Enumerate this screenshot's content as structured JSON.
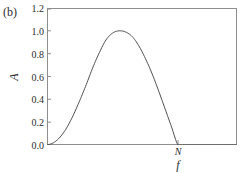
{
  "figure": {
    "panel_label": "(b)",
    "background_color": "#ffffff",
    "frame_color": "#8e8e8e",
    "curve_color": "#4d4d4d"
  },
  "chart_data": {
    "type": "line",
    "title": "",
    "subtitle": "",
    "panel": "(b)",
    "xlabel": "f",
    "ylabel": "A",
    "grid": false,
    "legend": false,
    "legend_position": "none",
    "xlim": [
      0,
      1.45
    ],
    "ylim": [
      0.0,
      1.2
    ],
    "yticks": [
      0.0,
      0.2,
      0.4,
      0.6,
      0.8,
      1.0,
      1.2
    ],
    "ytick_labels": [
      "0.0",
      "0.2",
      "0.4",
      "0.6",
      "0.8",
      "1.0",
      "1.2"
    ],
    "xticks": [
      1.0
    ],
    "xtick_labels": [
      "N"
    ],
    "annotations": [],
    "series": [
      {
        "name": "A(f)",
        "color": "#4d4d4d",
        "x": [
          0.0,
          0.05,
          0.1,
          0.15,
          0.2,
          0.25,
          0.3,
          0.35,
          0.4,
          0.45,
          0.5,
          0.55,
          0.6,
          0.65,
          0.7,
          0.75,
          0.8,
          0.85,
          0.9,
          0.95,
          1.0,
          1.05,
          1.1,
          1.2,
          1.3,
          1.45
        ],
        "y": [
          0.0,
          0.02,
          0.07,
          0.15,
          0.26,
          0.39,
          0.53,
          0.68,
          0.81,
          0.92,
          0.98,
          1.0,
          0.99,
          0.95,
          0.87,
          0.76,
          0.63,
          0.48,
          0.32,
          0.16,
          0.0,
          0.0,
          0.0,
          0.0,
          0.0,
          0.0
        ]
      }
    ]
  }
}
